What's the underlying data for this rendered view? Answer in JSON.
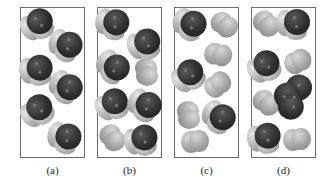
{
  "figure": {
    "panels": [
      {
        "id": "a",
        "label": "(a)",
        "left": 20,
        "molecules": [
          {
            "type": "dark",
            "x": 39,
            "y": 24,
            "rot": -30
          },
          {
            "type": "dark",
            "x": 67,
            "y": 46,
            "rot": 20
          },
          {
            "type": "dark",
            "x": 38,
            "y": 70,
            "rot": -10
          },
          {
            "type": "dark",
            "x": 67,
            "y": 88,
            "rot": 30
          },
          {
            "type": "dark",
            "x": 39,
            "y": 110,
            "rot": -40
          },
          {
            "type": "dark",
            "x": 66,
            "y": 138,
            "rot": 15
          }
        ]
      },
      {
        "id": "b",
        "label": "(b)",
        "left": 97,
        "molecules": [
          {
            "type": "dark",
            "x": 114,
            "y": 24,
            "rot": 10
          },
          {
            "type": "dark",
            "x": 146,
            "y": 44,
            "rot": -20
          },
          {
            "type": "dark",
            "x": 114,
            "y": 68,
            "rot": 35
          },
          {
            "type": "gray",
            "x": 146,
            "y": 72,
            "rot": 90
          },
          {
            "type": "dark",
            "x": 114,
            "y": 104,
            "rot": -30
          },
          {
            "type": "dark",
            "x": 146,
            "y": 106,
            "rot": 25
          },
          {
            "type": "gray",
            "x": 112,
            "y": 138,
            "rot": 60
          },
          {
            "type": "dark",
            "x": 143,
            "y": 140,
            "rot": -15
          }
        ]
      },
      {
        "id": "c",
        "label": "(c)",
        "left": 174,
        "molecules": [
          {
            "type": "dark",
            "x": 191,
            "y": 25,
            "rot": 20
          },
          {
            "type": "gray",
            "x": 224,
            "y": 25,
            "rot": 45
          },
          {
            "type": "gray",
            "x": 218,
            "y": 55,
            "rot": 20
          },
          {
            "type": "dark",
            "x": 190,
            "y": 75,
            "rot": -40
          },
          {
            "type": "gray",
            "x": 218,
            "y": 85,
            "rot": -30
          },
          {
            "type": "gray",
            "x": 188,
            "y": 115,
            "rot": 90
          },
          {
            "type": "dark",
            "x": 220,
            "y": 118,
            "rot": 30
          },
          {
            "type": "gray",
            "x": 195,
            "y": 142,
            "rot": 0
          }
        ]
      },
      {
        "id": "d",
        "label": "(d)",
        "left": 251,
        "molecules": [
          {
            "type": "gray",
            "x": 266,
            "y": 24,
            "rot": 50
          },
          {
            "type": "dark",
            "x": 295,
            "y": 24,
            "rot": 0
          },
          {
            "type": "dark",
            "x": 266,
            "y": 66,
            "rot": -35
          },
          {
            "type": "gray",
            "x": 298,
            "y": 62,
            "rot": -20
          },
          {
            "type": "gray",
            "x": 266,
            "y": 103,
            "rot": 45
          },
          {
            "type": "bigdark",
            "x": 294,
            "y": 95,
            "rot": 40
          },
          {
            "type": "dark",
            "x": 266,
            "y": 138,
            "rot": -10
          },
          {
            "type": "gray",
            "x": 297,
            "y": 140,
            "rot": 0
          }
        ]
      }
    ]
  },
  "colors": {
    "frame": "#6a6a6a",
    "dark_atom": "#2e2e2e",
    "light_atom": "#b9b9b9",
    "gray_molecule": "#a8a8a8"
  }
}
